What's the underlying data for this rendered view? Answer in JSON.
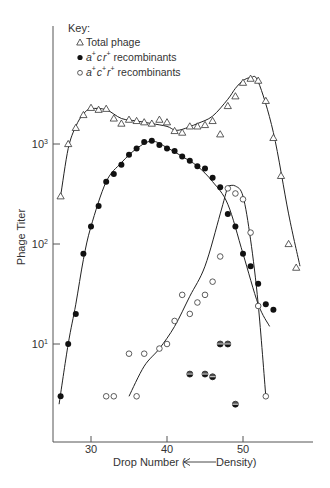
{
  "legend": {
    "title": "Key:",
    "items": [
      {
        "symbol": "open-triangle",
        "label": "Total phage"
      },
      {
        "symbol": "filled-circle",
        "label_parts": [
          "a",
          "+",
          "c",
          "",
          "r",
          "+"
        ],
        "label": "a+cr+ recombinants"
      },
      {
        "symbol": "open-circle",
        "label_parts": [
          "a",
          "+",
          "c",
          "+",
          "r",
          "+"
        ],
        "label": "a+c+r+ recombinants"
      }
    ]
  },
  "axes": {
    "xlabel": "Drop Number (⟵ Density)",
    "xlabel_left": "Drop Number (",
    "xlabel_right": "Density)",
    "ylabel": "Phage Titer",
    "xticks": [
      "30",
      "40",
      "50"
    ],
    "yticks": [
      {
        "base": "10",
        "exp": "1"
      },
      {
        "base": "10",
        "exp": "2"
      },
      {
        "base": "10",
        "exp": "3"
      }
    ]
  },
  "chart_data": {
    "type": "scatter",
    "title": "",
    "xlabel": "Drop Number (← Density)",
    "ylabel": "Phage Titer",
    "yscale": "log",
    "xlim": [
      24.5,
      59
    ],
    "ylim": [
      1,
      15000
    ],
    "xticks": [
      30,
      40,
      50
    ],
    "yticks": [
      10,
      100,
      1000
    ],
    "grid": false,
    "legend_position": "upper-left",
    "series": [
      {
        "name": "Total phage",
        "marker": "open-triangle",
        "x": [
          26,
          27,
          28,
          29,
          30,
          31,
          32,
          33,
          34,
          35,
          36,
          37,
          38,
          39,
          40,
          41,
          42,
          43,
          44,
          45,
          46,
          47,
          48,
          49,
          50,
          51,
          52,
          53,
          54,
          55,
          56,
          57
        ],
        "y": [
          300,
          1000,
          1450,
          1950,
          2300,
          2200,
          2250,
          1800,
          1600,
          1750,
          1700,
          1650,
          1600,
          1750,
          1650,
          1350,
          1300,
          1500,
          1500,
          1550,
          1700,
          1250,
          2400,
          3000,
          4100,
          4500,
          4300,
          2700,
          1150,
          480,
          100,
          58
        ]
      },
      {
        "name": "a+cr+ recombinants",
        "marker": "filled-circle",
        "x": [
          26,
          27,
          28,
          29,
          30,
          31,
          32,
          33,
          34,
          35,
          36,
          37,
          38,
          39,
          40,
          41,
          42,
          43,
          44,
          45,
          46,
          47,
          48,
          49,
          50,
          51,
          52,
          53,
          54
        ],
        "y": [
          3,
          10,
          20,
          80,
          150,
          240,
          420,
          500,
          620,
          780,
          900,
          1050,
          1080,
          980,
          900,
          850,
          750,
          680,
          600,
          570,
          460,
          370,
          200,
          150,
          80,
          60,
          40,
          25,
          22
        ]
      },
      {
        "name": "a+c+r+ recombinants",
        "marker": "open-circle",
        "x": [
          32,
          33,
          35,
          36,
          37,
          39,
          40,
          41,
          42,
          43,
          44,
          45,
          46,
          47,
          48,
          49,
          50,
          51,
          52,
          53
        ],
        "y": [
          3,
          3,
          8,
          3,
          8,
          9,
          10,
          17,
          31,
          20,
          26,
          31,
          42,
          75,
          360,
          320,
          280,
          130,
          24,
          3
        ]
      },
      {
        "name": "both recombinant types (half-filled)",
        "marker": "half-filled-circle",
        "x": [
          43,
          45,
          46,
          47,
          48,
          49
        ],
        "y": [
          5,
          5,
          4.7,
          10,
          10,
          2.5
        ]
      }
    ],
    "fitted_curves": [
      {
        "name": "Total phage curve",
        "x": [
          26,
          27,
          28,
          29,
          30,
          32,
          34,
          36,
          38,
          40,
          41,
          42,
          44,
          46,
          48,
          49,
          50,
          51,
          52,
          54,
          56,
          57.5
        ],
        "y": [
          300,
          900,
          1500,
          2000,
          2250,
          2200,
          1800,
          1700,
          1600,
          1500,
          1380,
          1400,
          1600,
          1900,
          2800,
          3600,
          4300,
          4600,
          4200,
          1300,
          200,
          60
        ]
      },
      {
        "name": "a+cr+ curve",
        "x": [
          25.8,
          27,
          28,
          29,
          30,
          32,
          34,
          36,
          38,
          40,
          42,
          44,
          46,
          48,
          50,
          52,
          53.5
        ],
        "y": [
          2.5,
          10,
          25,
          70,
          150,
          420,
          650,
          900,
          1070,
          920,
          750,
          600,
          420,
          250,
          80,
          25,
          15
        ]
      },
      {
        "name": "a+c+r+ rising curve",
        "x": [
          35,
          37,
          39,
          41,
          43,
          45,
          47,
          48
        ],
        "y": [
          3,
          6,
          9,
          15,
          30,
          60,
          200,
          380
        ]
      },
      {
        "name": "a+c+r+ falling curve",
        "x": [
          48,
          49,
          50,
          51,
          52,
          53
        ],
        "y": [
          380,
          380,
          300,
          110,
          25,
          3
        ]
      }
    ]
  }
}
